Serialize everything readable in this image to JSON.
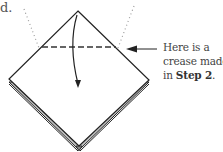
{
  "fragment_text": "d.",
  "callout": {
    "line1": "Here is a",
    "line2": "crease made",
    "line3_prefix": "in ",
    "line3_bold": "Step 2",
    "line3_suffix": "."
  },
  "diagram": {
    "elements": [
      "top-flap-outline",
      "back-layers-edges",
      "horizontal-crease-dashed-line",
      "fold-down-arrow",
      "dotted-guide-lines",
      "callout-leader-arrow"
    ],
    "colors": {
      "line": "#222222",
      "dotted": "#9a9a9a",
      "layer_fill": "#bdbdbd",
      "paper": "#ffffff"
    }
  }
}
